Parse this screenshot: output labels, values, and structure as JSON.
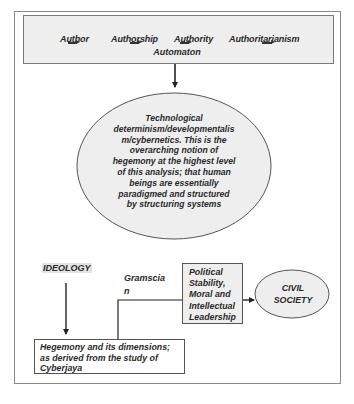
{
  "top_box": {
    "words": [
      "Author",
      "Authorship",
      "Authority",
      "Authoritarianism"
    ],
    "bottom_word": "Automaton",
    "fill_color": "#eeeeee"
  },
  "ellipse_main": {
    "lines": [
      "Technological",
      "determinism/developmentalis",
      "m/cybernetics.  This is the",
      "overarching notion of",
      "hegemony at the highest level",
      "of this analysis; that human",
      "beings are essentially",
      "paradigmed and structured",
      "by structuring systems"
    ],
    "fill_color": "#eeeeee"
  },
  "ideology_label": "IDEOLOGY",
  "gramscian_label": {
    "lines": [
      "Gramscia",
      "n"
    ]
  },
  "political_box": {
    "lines": [
      "Political",
      "Stability,",
      "Moral and",
      "Intellectual",
      "Leadership"
    ]
  },
  "civil_society": {
    "lines": [
      "CIVIL",
      "SOCIETY"
    ]
  },
  "hegemony_box": {
    "lines": [
      "Hegemony and its dimensions;",
      "as derived from the study of",
      "Cyberjaya"
    ]
  },
  "colors": {
    "stroke": "#333333",
    "frame": "#8a8a8a",
    "shape_fill": "#eeeeee"
  }
}
